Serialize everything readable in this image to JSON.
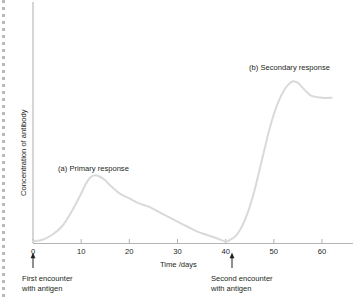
{
  "chart_data": {
    "type": "line",
    "title": "",
    "xlabel": "Time /days",
    "ylabel": "Concentration of antibody",
    "xlim": [
      0,
      64
    ],
    "ylim": [
      0,
      100
    ],
    "grid": false,
    "legend_position": "none",
    "xticks": [
      0,
      10,
      20,
      30,
      40,
      50,
      60
    ],
    "xtick_labels": [
      "0",
      "10",
      "20",
      "30",
      "40",
      "50",
      "60"
    ],
    "yticks": [],
    "ytick_labels": [],
    "series": [
      {
        "name": "Antibody concentration",
        "color": "#d9d9d9",
        "x": [
          0,
          2,
          4,
          6,
          8,
          10,
          11,
          12,
          13,
          14,
          15,
          16,
          18,
          20,
          22,
          24,
          26,
          28,
          30,
          32,
          34,
          36,
          38,
          40,
          41,
          42,
          43,
          44,
          45,
          46,
          47,
          48,
          49,
          50,
          51,
          52,
          53,
          54,
          55,
          56,
          57,
          58,
          60,
          62
        ],
        "values": [
          1,
          2,
          5,
          10,
          19,
          30,
          36,
          40,
          41,
          40,
          38,
          35,
          30,
          27,
          24,
          22,
          19,
          16,
          13,
          10,
          7,
          5,
          3,
          1,
          2,
          4,
          8,
          14,
          22,
          32,
          44,
          56,
          68,
          78,
          86,
          92,
          96,
          98,
          97,
          94,
          91,
          89,
          88,
          88
        ]
      }
    ],
    "annotations": [
      {
        "id": "primary-response",
        "text": "(a) Primary response",
        "x_px": 58,
        "y_px": 170
      },
      {
        "id": "secondary-response",
        "text": "(b) Secondary response",
        "x_px": 249,
        "y_px": 70
      }
    ],
    "event_markers": [
      {
        "id": "first-encounter",
        "x_day": 0,
        "line1": "First encounter",
        "line2": "with antigen"
      },
      {
        "id": "second-encounter",
        "x_day": 40,
        "line1": "Second encounter",
        "line2": "with antigen"
      }
    ],
    "colors": {
      "curve": "#d9d9d9",
      "axis": "#b4b4b4",
      "text": "#231f20",
      "background": "#ffffff",
      "edge_dots": "#b9b9b9"
    }
  }
}
